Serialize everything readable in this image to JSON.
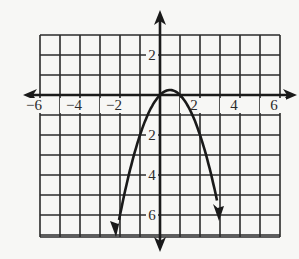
{
  "chart_data": {
    "type": "line",
    "title": "",
    "xlabel": "",
    "ylabel": "",
    "function": "y = -x^2 + x",
    "xlim": [
      -6,
      6
    ],
    "ylim": [
      -7,
      3
    ],
    "grid": true,
    "x_ticks": [
      {
        "value": -6,
        "label": "−6"
      },
      {
        "value": -4,
        "label": "−4"
      },
      {
        "value": -2,
        "label": "−2"
      },
      {
        "value": 2,
        "label": "2"
      },
      {
        "value": 4,
        "label": "4"
      },
      {
        "value": 6,
        "label": "6"
      }
    ],
    "y_ticks": [
      {
        "value": 2,
        "label": "2"
      },
      {
        "value": -2,
        "label": "2"
      },
      {
        "value": -4,
        "label": "4"
      },
      {
        "value": -6,
        "label": "6"
      }
    ],
    "series": [
      {
        "name": "parabola",
        "x": [
          -2.2,
          -2,
          -1.5,
          -1,
          -0.5,
          0,
          0.5,
          1,
          1.5,
          2,
          2.5,
          3
        ],
        "y": [
          -7.04,
          -6,
          -3.75,
          -2,
          -0.75,
          0,
          0.25,
          0,
          -0.75,
          -2,
          -3.75,
          -6
        ]
      }
    ],
    "colors": {
      "line": "#1a1a1a",
      "grid": "#2a2a2a",
      "background": "#f7f7f5"
    }
  }
}
